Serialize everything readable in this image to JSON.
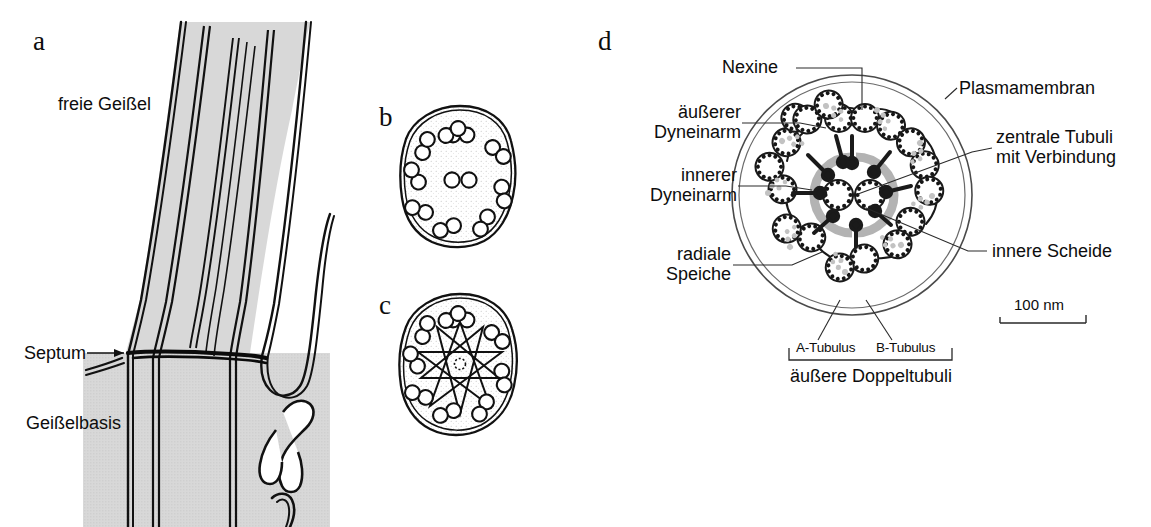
{
  "figure": {
    "background_color": "#ffffff",
    "ink_color": "#0d0d0d",
    "cytoplasm_fill": "#d4d4d4",
    "sheath_gray": "#b5b5b5",
    "dynein_gray": "#c0c0c0"
  },
  "panels": {
    "a": {
      "letter": "a",
      "labels": {
        "free_flagellum": "freie Geißel",
        "septum": "Septum",
        "flagellum_base": "Geißelbasis"
      }
    },
    "b": {
      "letter": "b",
      "description": "Querschnitt 9+2 Axonema",
      "outer_doublets": 9,
      "central_tubuli": 2
    },
    "c": {
      "letter": "c",
      "description": "Querschnitt mit radialen Speichen, 9+0",
      "outer_doublets": 9,
      "central_tubuli": 0
    },
    "d": {
      "letter": "d",
      "description": "Detailschema des Axonemas",
      "outer_doublets": 9,
      "central_tubuli": 2,
      "labels": {
        "nexine": "Nexine",
        "outer_dynein_arm": "äußerer\nDyneinarm",
        "inner_dynein_arm": "innerer\nDyneinarm",
        "radial_spoke": "radiale\nSpeiche",
        "plasma_membrane": "Plasmamembran",
        "central_tubuli": "zentrale Tubuli\nmit Verbindung",
        "inner_sheath": "innere Scheide",
        "a_tubulus": "A-Tubulus",
        "b_tubulus": "B-Tubulus",
        "outer_doublets": "äußere Doppeltubuli"
      },
      "scale_bar": {
        "label": "100 nm",
        "length_px": 86
      }
    }
  }
}
